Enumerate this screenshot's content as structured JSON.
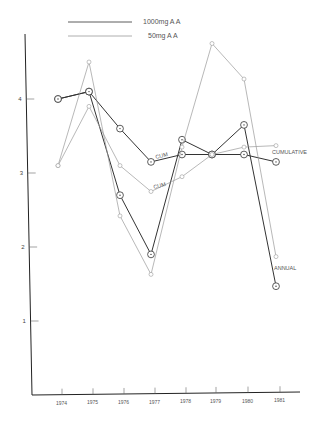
{
  "chart_data": {
    "type": "line",
    "title": "",
    "xlabel": "",
    "ylabel": "",
    "x": [
      1974,
      1975,
      1976,
      1977,
      1978,
      1979,
      1980,
      1981
    ],
    "x_tick_labels": [
      "1974",
      "1975",
      "1976",
      "1977",
      "1978",
      "1979",
      "1980",
      "1981"
    ],
    "y_tick_labels": [
      "1",
      "2",
      "3",
      "4"
    ],
    "ylim": [
      0,
      5
    ],
    "grid": false,
    "legend": {
      "position": "top",
      "entries": [
        {
          "label": "1000mg A A",
          "color": "#333333"
        },
        {
          "label": "50mg A A",
          "color": "#9a9a9a"
        }
      ]
    },
    "annotations": [
      "CUM",
      "CUM",
      "CUMULATIVE",
      "ANNUAL"
    ],
    "series": [
      {
        "name": "1000mg A A annual",
        "color": "#333333",
        "values": [
          4.0,
          4.1,
          2.7,
          1.9,
          3.45,
          3.25,
          3.65,
          1.47
        ]
      },
      {
        "name": "1000mg A A cumulative",
        "color": "#333333",
        "values": [
          4.0,
          4.1,
          3.6,
          3.15,
          3.25,
          3.25,
          3.25,
          3.15
        ]
      },
      {
        "name": "50mg A A annual",
        "color": "#9a9a9a",
        "values": [
          3.1,
          4.5,
          2.42,
          1.63,
          3.35,
          4.75,
          4.27,
          1.87
        ]
      },
      {
        "name": "50mg A A cumulative",
        "color": "#9a9a9a",
        "values": [
          3.1,
          3.9,
          3.1,
          2.75,
          2.95,
          3.25,
          3.35,
          3.37
        ]
      }
    ]
  }
}
